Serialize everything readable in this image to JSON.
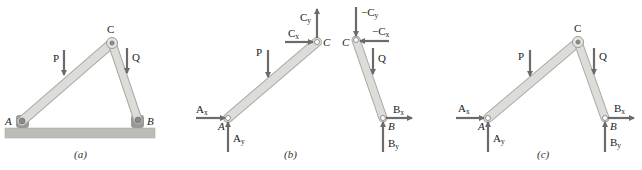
{
  "colors": {
    "member_fill": "#d9d9d6",
    "member_stroke": "#a9a9a5",
    "arrow": "#6b6b6b",
    "ground_fill": "#bdbdb8",
    "pin_fill": "#9a9a95",
    "text": "#222222"
  },
  "panels": [
    {
      "caption": "(a)",
      "labels": {
        "A": "A",
        "B": "B",
        "C": "C",
        "P": "P",
        "Q": "Q"
      }
    },
    {
      "caption": "(b)",
      "labels": {
        "A": "A",
        "C_left": "C",
        "C_right": "C",
        "B": "B",
        "P": "P",
        "Q": "Q",
        "Ax": "A",
        "Ax_sub": "x",
        "Ay": "A",
        "Ay_sub": "y",
        "Cx": "C",
        "Cx_sub": "x",
        "Cy": "C",
        "Cy_sub": "y",
        "negCx": "−C",
        "negCx_sub": "x",
        "negCy": "−C",
        "negCy_sub": "y",
        "Bx": "B",
        "Bx_sub": "x",
        "By": "B",
        "By_sub": "y"
      }
    },
    {
      "caption": "(c)",
      "labels": {
        "A": "A",
        "B": "B",
        "C": "C",
        "P": "P",
        "Q": "Q",
        "Ax": "A",
        "Ax_sub": "x",
        "Ay": "A",
        "Ay_sub": "y",
        "Bx": "B",
        "Bx_sub": "x",
        "By": "B",
        "By_sub": "y"
      }
    }
  ]
}
